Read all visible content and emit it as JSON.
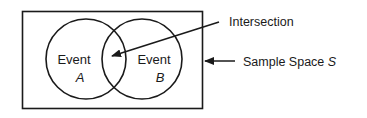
{
  "diagram": {
    "type": "venn",
    "sample_space": {
      "label_prefix": "Sample Space ",
      "label_symbol": "S"
    },
    "events": [
      {
        "label": "Event",
        "symbol": "A"
      },
      {
        "label": "Event",
        "symbol": "B"
      }
    ],
    "intersection": {
      "label": "Intersection"
    },
    "colors": {
      "stroke": "#1a1a1a",
      "background": "#ffffff"
    }
  }
}
